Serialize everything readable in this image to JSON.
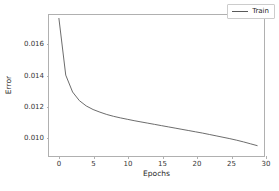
{
  "chart_data": {
    "type": "line",
    "title": "",
    "xlabel": "Epochs",
    "ylabel": "Error",
    "xlim": [
      -1.45,
      30.0
    ],
    "ylim": [
      0.00875,
      0.01785
    ],
    "xticks": [
      0,
      5,
      10,
      15,
      20,
      25,
      30
    ],
    "xtick_labels": [
      "0",
      "5",
      "10",
      "15",
      "20",
      "25",
      "30"
    ],
    "yticks": [
      0.01,
      0.012,
      0.014,
      0.016
    ],
    "ytick_labels": [
      "0.010",
      "0.012",
      "0.014",
      "0.016"
    ],
    "grid": false,
    "legend_position": "upper right",
    "line_color": "#595959",
    "series": [
      {
        "name": "Train",
        "x": [
          0,
          1,
          2,
          3,
          4,
          5,
          6,
          7,
          8,
          9,
          10,
          11,
          12,
          13,
          14,
          15,
          16,
          17,
          18,
          19,
          20,
          21,
          22,
          23,
          24,
          25,
          26,
          27,
          28,
          29
        ],
        "values": [
          0.01763,
          0.01397,
          0.01288,
          0.01232,
          0.01198,
          0.01175,
          0.01158,
          0.01143,
          0.01131,
          0.01121,
          0.01112,
          0.01103,
          0.01095,
          0.01087,
          0.01079,
          0.01071,
          0.01063,
          0.01055,
          0.01047,
          0.01039,
          0.01031,
          0.01023,
          0.01014,
          0.01005,
          0.00996,
          0.00987,
          0.00977,
          0.00966,
          0.00954,
          0.00942
        ]
      }
    ]
  },
  "legend": {
    "entries": [
      {
        "label": "Train",
        "color": "#595959"
      }
    ]
  }
}
